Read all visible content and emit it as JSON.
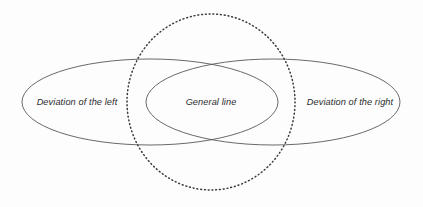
{
  "diagram": {
    "type": "venn-diagram",
    "title": "",
    "canvas": {
      "width": 423,
      "height": 207,
      "background_color": "#fdfdfd"
    },
    "colors": {
      "outline_stroke": "#58585a",
      "dotted_stroke": "#3a3a3c",
      "label_text": "#2b2b2d"
    },
    "sets": [
      {
        "id": "left-ellipse",
        "label": "Deviation of the left",
        "shape": "ellipse",
        "style": "solid",
        "cx": 150,
        "cy": 102,
        "rx": 128,
        "ry": 43,
        "label_x": 77,
        "label_y": 103
      },
      {
        "id": "right-ellipse",
        "label": "Deviation of the right",
        "shape": "ellipse",
        "style": "solid",
        "cx": 273,
        "cy": 102,
        "rx": 127,
        "ry": 43,
        "label_x": 350,
        "label_y": 103
      },
      {
        "id": "dotted-circle",
        "label": "",
        "shape": "circle",
        "style": "dotted",
        "cx": 211,
        "cy": 102,
        "rx": 84,
        "ry": 88,
        "label_x": 211,
        "label_y": 102
      }
    ],
    "intersection": {
      "id": "center-lens",
      "label": "General line",
      "label_x": 211,
      "label_y": 103
    }
  }
}
